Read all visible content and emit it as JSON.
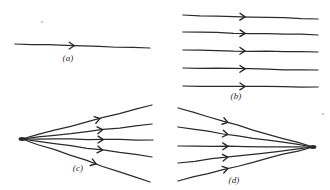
{
  "figure": {
    "background_color": "#ffffff",
    "ink_color": "#2b2b2b",
    "width": 330,
    "height": 190
  },
  "panels": [
    {
      "id": "a",
      "caption": "(a)",
      "caption_x": 68,
      "caption_y": 58,
      "description": "single ray",
      "kind": "single",
      "rays": [
        {
          "x1": 15,
          "y1": 44,
          "x2": 150,
          "y2": 48,
          "arrow_t": 0.44
        }
      ]
    },
    {
      "id": "b",
      "caption": "(b)",
      "caption_x": 236,
      "caption_y": 96,
      "description": "parallel beam of rays",
      "kind": "parallel",
      "rays": [
        {
          "x1": 183,
          "y1": 15,
          "x2": 318,
          "y2": 19,
          "arrow_t": 0.46
        },
        {
          "x1": 183,
          "y1": 32,
          "x2": 318,
          "y2": 35,
          "arrow_t": 0.46
        },
        {
          "x1": 183,
          "y1": 50,
          "x2": 318,
          "y2": 52,
          "arrow_t": 0.46
        },
        {
          "x1": 183,
          "y1": 68,
          "x2": 318,
          "y2": 70,
          "arrow_t": 0.46
        },
        {
          "x1": 183,
          "y1": 86,
          "x2": 318,
          "y2": 87,
          "arrow_t": 0.46
        }
      ]
    },
    {
      "id": "c",
      "caption": "(c)",
      "caption_x": 78,
      "caption_y": 168,
      "description": "diverging beam from a point source",
      "kind": "diverging",
      "focus": {
        "x": 22,
        "y": 139
      },
      "rays": [
        {
          "x1": 22,
          "y1": 139,
          "x2": 152,
          "y2": 105,
          "arrow_t": 0.6
        },
        {
          "x1": 22,
          "y1": 139,
          "x2": 152,
          "y2": 124,
          "arrow_t": 0.62
        },
        {
          "x1": 22,
          "y1": 139,
          "x2": 153,
          "y2": 140,
          "arrow_t": 0.62
        },
        {
          "x1": 22,
          "y1": 139,
          "x2": 152,
          "y2": 157,
          "arrow_t": 0.62
        },
        {
          "x1": 22,
          "y1": 139,
          "x2": 150,
          "y2": 182,
          "arrow_t": 0.58
        }
      ]
    },
    {
      "id": "d",
      "caption": "(d)",
      "caption_x": 234,
      "caption_y": 180,
      "description": "converging beam to a point",
      "kind": "converging",
      "focus": {
        "x": 313,
        "y": 147
      },
      "rays": [
        {
          "x1": 178,
          "y1": 108,
          "x2": 313,
          "y2": 147,
          "arrow_t": 0.37
        },
        {
          "x1": 178,
          "y1": 127,
          "x2": 313,
          "y2": 147,
          "arrow_t": 0.37
        },
        {
          "x1": 178,
          "y1": 146,
          "x2": 313,
          "y2": 147,
          "arrow_t": 0.37
        },
        {
          "x1": 178,
          "y1": 163,
          "x2": 313,
          "y2": 147,
          "arrow_t": 0.37
        },
        {
          "x1": 178,
          "y1": 181,
          "x2": 313,
          "y2": 147,
          "arrow_t": 0.37
        }
      ]
    }
  ],
  "specks": [
    {
      "x": 41,
      "y": 21,
      "size": 2
    },
    {
      "x": 322,
      "y": 113,
      "size": 2
    }
  ]
}
